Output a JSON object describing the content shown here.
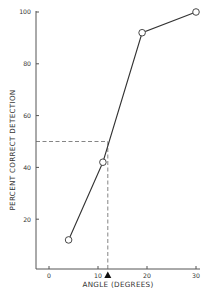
{
  "chart_data": {
    "type": "line",
    "title": "",
    "xlabel": "ANGLE (DEGREES)",
    "ylabel": "PERCENT CORRECT DETECTION",
    "x": [
      4,
      11,
      19,
      30
    ],
    "series": [
      {
        "name": "Percent correct detection",
        "values": [
          12,
          42,
          92,
          100
        ],
        "marker": "open-circle"
      }
    ],
    "xlim": [
      -3,
      31
    ],
    "ylim": [
      0,
      100
    ],
    "xticks": [
      0,
      10,
      20,
      30
    ],
    "yticks": [
      20,
      40,
      60,
      80,
      100
    ],
    "xtick_labels": [
      "0",
      "10",
      "20",
      "30"
    ],
    "ytick_labels": [
      "20",
      "40",
      "60",
      "80",
      "100"
    ],
    "grid": false,
    "legend": null,
    "annotations": [
      {
        "type": "dashed-horizontal",
        "y": 50,
        "from_x": -3,
        "to_x": 12
      },
      {
        "type": "dashed-vertical",
        "x": 12,
        "from_y": 0,
        "to_y": 50
      },
      {
        "type": "threshold-marker",
        "shape": "filled-triangle",
        "x": 12,
        "label": ""
      }
    ]
  },
  "colors": {
    "line": "#333333",
    "axis": "#555555",
    "dashed": "#666666",
    "marker_fill": "#ffffff",
    "triangle": "#111111"
  }
}
